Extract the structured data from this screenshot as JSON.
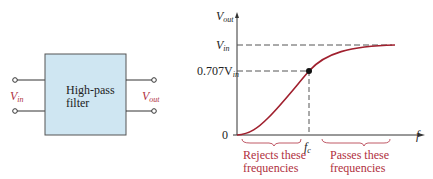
{
  "block": {
    "label_line1": "High-pass",
    "label_line2": "filter",
    "input_label": "V",
    "input_sub": "in",
    "output_label": "V",
    "output_sub": "out",
    "fill_color": "#cfe6f2",
    "label_color": "#b03040"
  },
  "graph": {
    "y_axis_label": "V",
    "y_axis_sub": "out",
    "x_axis_label": "f",
    "tick_vin": "V",
    "tick_vin_sub": "in",
    "tick_707": "0.707V",
    "tick_707_sub": "in",
    "tick_zero": "0",
    "tick_fc": "f",
    "tick_fc_sub": "c",
    "reject_line1": "Rejects these",
    "reject_line2": "frequencies",
    "pass_line1": "Passes these",
    "pass_line2": "frequencies",
    "curve_color": "#a0202e",
    "annotation_color": "#b03040"
  }
}
